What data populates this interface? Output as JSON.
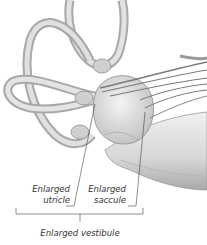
{
  "diagram": {
    "labels": {
      "utricle_line1": "Enlarged",
      "utricle_line2": "utricle",
      "saccule_line1": "Enlarged",
      "saccule_line2": "saccule",
      "vestibule": "Enlarged vestibule"
    },
    "colors": {
      "background": "#ffffff",
      "tissue_light": "#e6e6e6",
      "tissue_mid": "#c8c8c8",
      "tissue_dark": "#8f8f8f",
      "nerve": "#7a7a7a",
      "leader_line": "#444444",
      "label_text": "#333333"
    }
  }
}
